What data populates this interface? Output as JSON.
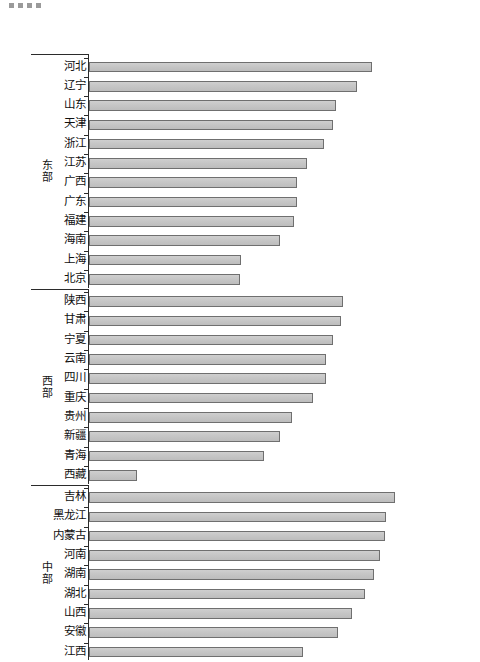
{
  "decoration": {
    "dots": [
      "dot-1",
      "dot-2",
      "dot-3",
      "dot-4"
    ],
    "dot_color": "#9a9a9a"
  },
  "chart_data": {
    "type": "bar",
    "orientation": "horizontal",
    "title": "",
    "subtitle": "",
    "xlabel": "",
    "ylabel": "",
    "grid": false,
    "legend": null,
    "axis_line_color": "#2b2b2b",
    "bar_fill": "#c6c6c6",
    "bar_border": "#6f6f6f",
    "xlim": [
      0,
      100
    ],
    "groups": [
      {
        "name": "东部",
        "name_chars": [
          "东",
          "部"
        ],
        "categories": [
          "河北",
          "辽宁",
          "山东",
          "天津",
          "浙江",
          "江苏",
          "广西",
          "广东",
          "福建",
          "海南",
          "上海",
          "北京"
        ],
        "values": [
          74.0,
          69.9,
          64.5,
          63.7,
          61.4,
          56.8,
          54.2,
          54.2,
          53.4,
          49.8,
          39.8,
          39.3
        ]
      },
      {
        "name": "西部",
        "name_chars": [
          "西",
          "部"
        ],
        "categories": [
          "陕西",
          "甘肃",
          "宁夏",
          "云南",
          "四川",
          "重庆",
          "贵州",
          "新疆",
          "青海",
          "西藏"
        ],
        "values": [
          66.2,
          65.9,
          63.7,
          61.9,
          61.9,
          58.6,
          53.1,
          49.8,
          45.8,
          12.5
        ]
      },
      {
        "name": "中部",
        "name_chars": [
          "中",
          "部"
        ],
        "categories": [
          "吉林",
          "黑龙江",
          "内蒙古",
          "河南",
          "湖南",
          "湖北",
          "山西",
          "安徽",
          "江西"
        ],
        "values": [
          79.8,
          77.6,
          77.2,
          76.1,
          74.3,
          72.1,
          68.6,
          65.1,
          56.0
        ]
      }
    ]
  }
}
